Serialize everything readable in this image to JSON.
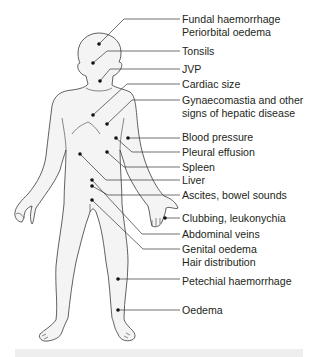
{
  "figure": {
    "type": "anatomical-annotation-diagram",
    "colors": {
      "outline": "#3a3a3a",
      "fill": "#f4f4f4",
      "leader": "#333333",
      "dot": "#111111",
      "text": "#231f20"
    }
  },
  "labels": [
    {
      "id": "fundal",
      "lines": [
        "Fundal haemorrhage",
        "Periorbital oedema"
      ],
      "top": 14,
      "dot": [
        99,
        44
      ],
      "elbow": [
        128,
        19
      ]
    },
    {
      "id": "tonsils",
      "lines": [
        "Tonsils"
      ],
      "top": 45,
      "dot": [
        93,
        63
      ],
      "elbow": [
        110,
        51
      ]
    },
    {
      "id": "jvp",
      "lines": [
        "JVP"
      ],
      "top": 63,
      "dot": [
        100,
        81
      ],
      "elbow": [
        112,
        69
      ]
    },
    {
      "id": "cardiac",
      "lines": [
        "Cardiac size"
      ],
      "top": 78,
      "dot": [
        93,
        115
      ],
      "elbow": [
        130,
        84
      ]
    },
    {
      "id": "gynaecomastia",
      "lines": [
        "Gynaecomastia and other",
        "signs of hepatic disease"
      ],
      "top": 94,
      "dot": [
        107,
        124
      ],
      "elbow": [
        135,
        100
      ]
    },
    {
      "id": "bp",
      "lines": [
        "Blood pressure"
      ],
      "top": 131,
      "dot": [
        128,
        138
      ],
      "elbow": [
        128,
        138
      ]
    },
    {
      "id": "pleural",
      "lines": [
        "Pleural effusion"
      ],
      "top": 146,
      "dot": [
        116,
        138
      ],
      "elbow": [
        131,
        152
      ]
    },
    {
      "id": "spleen",
      "lines": [
        "Spleen"
      ],
      "top": 161,
      "dot": [
        107,
        152
      ],
      "elbow": [
        122,
        167
      ]
    },
    {
      "id": "liver",
      "lines": [
        "Liver"
      ],
      "top": 174,
      "dot": [
        80,
        154
      ],
      "elbow": [
        107,
        180
      ]
    },
    {
      "id": "ascites",
      "lines": [
        "Ascites, bowel sounds"
      ],
      "top": 189,
      "dot": [
        92,
        180
      ],
      "dot2": [
        92,
        186
      ],
      "elbow": [
        108,
        195
      ]
    },
    {
      "id": "clubbing",
      "lines": [
        "Clubbing, leukonychia"
      ],
      "top": 212,
      "dot": [
        165,
        218
      ],
      "elbow": [
        165,
        218
      ]
    },
    {
      "id": "abdominal_veins",
      "lines": [
        "Abdominal veins"
      ],
      "top": 228,
      "dot": [
        92,
        186
      ],
      "elbow": [
        142,
        234
      ]
    },
    {
      "id": "genital",
      "lines": [
        "Genital oedema",
        "Hair distribution"
      ],
      "top": 243,
      "dot": [
        92,
        200
      ],
      "elbow": [
        143,
        249
      ]
    },
    {
      "id": "petechial",
      "lines": [
        "Petechial haemorrhage"
      ],
      "top": 275,
      "dot": [
        118,
        279
      ],
      "elbow": [
        118,
        279
      ]
    },
    {
      "id": "oedema",
      "lines": [
        "Oedema"
      ],
      "top": 304,
      "dot": [
        118,
        310
      ],
      "elbow": [
        118,
        310
      ]
    }
  ],
  "text": {
    "fundal_1": "Fundal haemorrhage",
    "fundal_2": "Periorbital oedema",
    "tonsils": "Tonsils",
    "jvp": "JVP",
    "cardiac": "Cardiac size",
    "gyn_1": "Gynaecomastia and other",
    "gyn_2": "signs of hepatic disease",
    "bp": "Blood pressure",
    "pleural": "Pleural effusion",
    "spleen": "Spleen",
    "liver": "Liver",
    "ascites": "Ascites, bowel sounds",
    "clubbing": "Clubbing, leukonychia",
    "abdominal": "Abdominal veins",
    "genital_1": "Genital oedema",
    "genital_2": "Hair distribution",
    "petechial": "Petechial haemorrhage",
    "oedema": "Oedema"
  }
}
